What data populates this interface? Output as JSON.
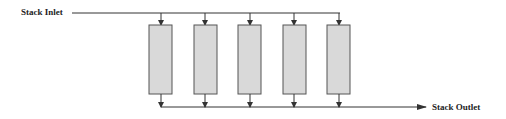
{
  "diagram": {
    "inlet_label": "Stack Inlet",
    "outlet_label": "Stack Outlet",
    "cell_count": 5,
    "colors": {
      "line": "#333333",
      "cell_fill": "#d9d9d9",
      "cell_stroke": "#555555"
    }
  }
}
